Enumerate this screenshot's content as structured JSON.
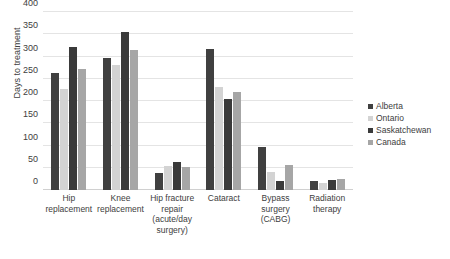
{
  "chart_data": {
    "type": "bar",
    "title": "",
    "subtitle": "",
    "xlabel": "",
    "ylabel": "Days to treatment",
    "ylim": [
      0,
      400
    ],
    "ytick_step": 50,
    "yticks": [
      0,
      50,
      100,
      150,
      200,
      250,
      300,
      350,
      400
    ],
    "ytick_labels": [
      "0",
      "50",
      "100",
      "150",
      "200",
      "250",
      "300",
      "350",
      "400"
    ],
    "grid": true,
    "grid_axis": "y",
    "legend_position": "right",
    "categories": [
      "Hip replacement",
      "Knee replacement",
      "Hip fracture repair (acute/day surgery)",
      "Cataract",
      "Bypass surgery (CABG)",
      "Radiation therapy"
    ],
    "category_lines": [
      [
        "Hip",
        "replacement"
      ],
      [
        "Knee",
        "replacement"
      ],
      [
        "Hip fracture",
        "repair",
        "(acute/day",
        "surgery)"
      ],
      [
        "Cataract"
      ],
      [
        "Bypass",
        "surgery",
        "(CABG)"
      ],
      [
        "Radiation",
        "therapy"
      ]
    ],
    "series": [
      {
        "name": "Alberta",
        "color": "#404040",
        "values": [
          263,
          297,
          38,
          316,
          96,
          20
        ]
      },
      {
        "name": "Ontario",
        "color": "#d3d3d3",
        "values": [
          227,
          282,
          53,
          231,
          40,
          16
        ]
      },
      {
        "name": "Saskatchewan",
        "color": "#3a3a3a",
        "values": [
          321,
          354,
          63,
          204,
          20,
          23
        ]
      },
      {
        "name": "Canada",
        "color": "#a6a6a6",
        "values": [
          273,
          314,
          52,
          220,
          57,
          24
        ]
      }
    ]
  }
}
